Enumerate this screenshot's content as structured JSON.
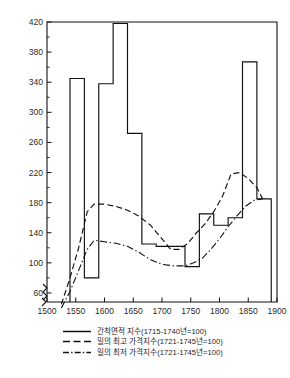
{
  "chart_data": {
    "type": "line",
    "title": "",
    "xlabel": "",
    "ylabel": "",
    "xlim": [
      1500,
      1900
    ],
    "ylim": [
      40,
      420
    ],
    "y_axis_broken_below": 60,
    "grid": false,
    "legend_position": "below-plot",
    "xticks": [
      1500,
      1550,
      1600,
      1650,
      1700,
      1750,
      1800,
      1850,
      1900
    ],
    "yticks": [
      60,
      100,
      140,
      180,
      220,
      260,
      300,
      340,
      380,
      420
    ],
    "yticks_minor": [
      80,
      120,
      160,
      200,
      240,
      280,
      320,
      360,
      400
    ],
    "series": [
      {
        "name": "간척면적 지수(1715-1740년=100)",
        "style": "solid-step",
        "type": "step",
        "x": [
          1540,
          1565,
          1565,
          1590,
          1590,
          1615,
          1615,
          1640,
          1640,
          1665,
          1665,
          1690,
          1690,
          1715,
          1715,
          1740,
          1740,
          1765,
          1765,
          1790,
          1790,
          1815,
          1815,
          1840,
          1840,
          1865,
          1865,
          1890
        ],
        "values": [
          345,
          345,
          80,
          80,
          338,
          338,
          418,
          418,
          272,
          272,
          125,
          125,
          122,
          122,
          122,
          122,
          95,
          95,
          165,
          165,
          150,
          150,
          160,
          160,
          367,
          367,
          185,
          185
        ],
        "steps": [
          {
            "from": 1540,
            "to": 1565,
            "value": 345
          },
          {
            "from": 1565,
            "to": 1590,
            "value": 80
          },
          {
            "from": 1590,
            "to": 1615,
            "value": 338
          },
          {
            "from": 1615,
            "to": 1640,
            "value": 418
          },
          {
            "from": 1640,
            "to": 1665,
            "value": 272
          },
          {
            "from": 1665,
            "to": 1690,
            "value": 125
          },
          {
            "from": 1690,
            "to": 1715,
            "value": 122
          },
          {
            "from": 1715,
            "to": 1740,
            "value": 122
          },
          {
            "from": 1740,
            "to": 1765,
            "value": 95
          },
          {
            "from": 1765,
            "to": 1790,
            "value": 165
          },
          {
            "from": 1790,
            "to": 1815,
            "value": 150
          },
          {
            "from": 1815,
            "to": 1840,
            "value": 160
          },
          {
            "from": 1840,
            "to": 1865,
            "value": 367
          },
          {
            "from": 1865,
            "to": 1890,
            "value": 185
          }
        ]
      },
      {
        "name": "밀의 최고 가격지수(1721-1745년=100)",
        "style": "dashed",
        "type": "line",
        "x": [
          1525,
          1540,
          1555,
          1570,
          1582,
          1600,
          1620,
          1640,
          1660,
          1680,
          1700,
          1715,
          1730,
          1745,
          1760,
          1775,
          1790,
          1805,
          1820,
          1835,
          1850,
          1865,
          1875
        ],
        "values": [
          45,
          80,
          120,
          168,
          178,
          178,
          175,
          170,
          162,
          150,
          132,
          118,
          118,
          126,
          140,
          152,
          168,
          188,
          218,
          220,
          212,
          200,
          185
        ]
      },
      {
        "name": "밀의 최저 가격지수(1721-1745년=100)",
        "style": "dash-dot",
        "type": "line",
        "x": [
          1525,
          1540,
          1555,
          1570,
          1582,
          1600,
          1620,
          1640,
          1660,
          1680,
          1700,
          1720,
          1740,
          1755,
          1770,
          1785,
          1800,
          1815,
          1830,
          1845,
          1860,
          1875
        ],
        "values": [
          40,
          62,
          90,
          118,
          130,
          128,
          126,
          122,
          114,
          104,
          98,
          96,
          96,
          100,
          106,
          118,
          132,
          148,
          162,
          175,
          183,
          185
        ]
      }
    ]
  },
  "legend": {
    "items": [
      {
        "key": "solid-line-key",
        "label": "간척면적 지수(1715-1740년=100)"
      },
      {
        "key": "dashed-line-key",
        "label": "밀의 최고 가격지수(1721-1745년=100)"
      },
      {
        "key": "dash-dot-line-key",
        "label": "밀의 최저 가격지수(1721-1745년=100)"
      }
    ]
  }
}
